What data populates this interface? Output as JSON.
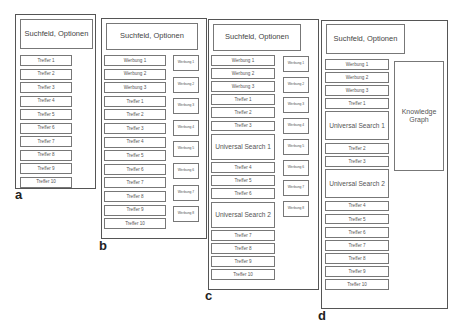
{
  "panels": [
    {
      "label": "a",
      "header": "Suchfeld, Optionen",
      "main": [
        "Treffer 1",
        "Treffer 2",
        "Treffer 3",
        "Treffer 4",
        "Treffer 5",
        "Treffer 6",
        "Treffer 7",
        "Treffer 8",
        "Treffer 9",
        "Treffer 10"
      ],
      "sidebar": []
    },
    {
      "label": "b",
      "header": "Suchfeld, Optionen",
      "main": [
        "Werbung 1",
        "Werbung 2",
        "Werbung 3",
        "Treffer 1",
        "Treffer 2",
        "Treffer 3",
        "Treffer 4",
        "Treffer 5",
        "Treffer 6",
        "Treffer 7",
        "Treffer 8",
        "Treffer 9",
        "Treffer 10"
      ],
      "sidebar": [
        "Werbung 1",
        "Werbung 2",
        "Werbung 3",
        "Werbung 4",
        "Werbung 5",
        "Werbung 6",
        "Werbung 7",
        "Werbung 8"
      ]
    },
    {
      "label": "c",
      "header": "Suchfeld, Optionen",
      "main": [
        "Werbung 1",
        "Werbung 2",
        "Werbung 3",
        "Treffer 1",
        "Treffer 2",
        "Treffer 3",
        "Universal Search 1",
        "Treffer 4",
        "Treffer 5",
        "Treffer 6",
        "Universal Search 2",
        "Treffer 7",
        "Treffer 8",
        "Treffer 9",
        "Treffer 10"
      ],
      "sidebar": [
        "Werbung 1",
        "Werbung 2",
        "Werbung 3",
        "Werbung 4",
        "Werbung 5",
        "Werbung 6",
        "Werbung 7",
        "Werbung 8"
      ]
    },
    {
      "label": "d",
      "header": "Suchfeld, Optionen",
      "main": [
        "Werbung 1",
        "Werbung 2",
        "Werbung 3",
        "Treffer 1",
        "Universal Search 1",
        "Treffer 2",
        "Treffer 3",
        "Universal Search 2",
        "Treffer 4",
        "Treffer 5",
        "Treffer 6",
        "Treffer 7",
        "Treffer 8",
        "Treffer 9",
        "Treffer 10"
      ],
      "knowledge_graph": "Knowledge Graph"
    }
  ]
}
